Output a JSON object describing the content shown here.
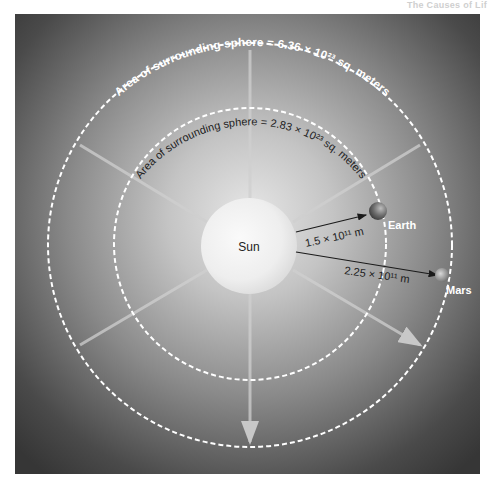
{
  "header": {
    "text": "The Causes of Lif"
  },
  "diagram": {
    "sun_label": "Sun",
    "outer_sphere_label": "Area of surrounding sphere = 6.36 × 10²³ sq. meters",
    "inner_sphere_label": "Area of surrounding sphere = 2.83 × 10²³ sq. meters",
    "earth_label": "Earth",
    "mars_label": "Mars",
    "earth_distance": "1.5 × 10¹¹ m",
    "mars_distance": "2.25 × 10¹¹ m",
    "colors": {
      "background_dark": "#3a3a3a",
      "glow": "#d9d9d9",
      "sun": "#f0f0f0",
      "dashed_circle": "#ffffff",
      "arrow": "#1a1a1a"
    }
  }
}
